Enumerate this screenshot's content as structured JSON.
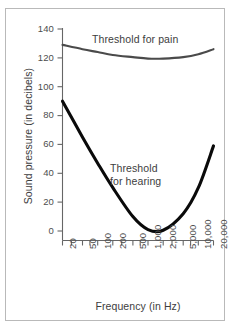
{
  "chart_data": {
    "type": "line",
    "title": "",
    "xlabel": "Frequency (in Hz)",
    "ylabel": "Sound pressure (in decibels)",
    "x_scale": "log",
    "xlim": [
      20,
      20000
    ],
    "ylim": [
      0,
      140
    ],
    "grid": false,
    "legend_position": "inline-annotations",
    "x_tick_labels": [
      "20",
      "50",
      "100",
      "200",
      "500",
      "1,000",
      "2,000",
      "5,000",
      "10,000",
      "20,000"
    ],
    "x_tick_values": [
      20,
      50,
      100,
      200,
      500,
      1000,
      2000,
      5000,
      10000,
      20000
    ],
    "y_tick_labels": [
      "0",
      "20",
      "40",
      "60",
      "80",
      "100",
      "120",
      "140"
    ],
    "y_tick_values": [
      0,
      20,
      40,
      60,
      80,
      100,
      120,
      140
    ],
    "series": [
      {
        "name": "Threshold for pain",
        "color": "#4a4a4a",
        "annotation": "Threshold for pain",
        "x": [
          20,
          50,
          100,
          200,
          500,
          1000,
          2000,
          5000,
          10000,
          20000
        ],
        "values": [
          129,
          126,
          124,
          122,
          120.5,
          119.5,
          119.5,
          120.5,
          122.5,
          126
        ]
      },
      {
        "name": "Threshold for hearing",
        "color": "#0a0a0a",
        "annotation": "Threshold\nfor hearing",
        "x": [
          20,
          50,
          100,
          200,
          500,
          1000,
          2000,
          5000,
          10000,
          20000
        ],
        "values": [
          90,
          65,
          47,
          30,
          10,
          1,
          0.5,
          12,
          30,
          59
        ]
      }
    ],
    "annotations": [
      {
        "text": "Threshold for pain",
        "x": 130,
        "y": 132
      },
      {
        "text_line1": "Threshold",
        "text_line2": "for hearing",
        "x": 600,
        "y": 45
      }
    ]
  },
  "figure": {
    "background": "#ffffff",
    "frame_color": "#b9b9b9",
    "axis_color": "#666666",
    "text_color": "#3d3d3d"
  }
}
